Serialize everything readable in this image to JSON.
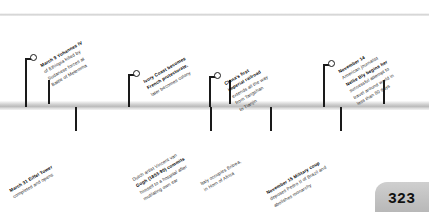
{
  "page": {
    "number": "323",
    "year_spine_label": ""
  },
  "timeline": {
    "ticks_above": [
      48,
      229,
      383
    ],
    "ticks_below": [
      75,
      210,
      270,
      340
    ],
    "events_above": [
      {
        "id": "yohannes-iv",
        "date": "March 9",
        "headline": "Yohannes IV",
        "lines": [
          "March 9 Yohannes IV",
          "of Ethiopia killed by",
          "Sudanese forces at",
          "Battle of Metemma"
        ],
        "bold_segments": [
          "March 9 Yohannes IV",
          "Sudanese"
        ]
      },
      {
        "id": "ivory-coast",
        "date": "",
        "headline": "Ivory Coast",
        "lines": [
          "Ivory Coast becomes",
          "French protectorate,",
          "later becomes colony"
        ],
        "bold_segments": [
          "Ivory Coast",
          "French protectorate,"
        ]
      },
      {
        "id": "china-railroad",
        "date": "",
        "headline": "China's first imperial railroad",
        "lines": [
          "China's first",
          "imperial railroad",
          "extends all the way",
          "from Tangshan",
          "to Tianjin"
        ],
        "bold_segments": [
          "China's first",
          "imperial railroad"
        ]
      },
      {
        "id": "nellie-bly",
        "date": "November 14",
        "headline": "Nellie Bly",
        "lines": [
          "November 14",
          "American journalist",
          "Nellie Bly begins her",
          "successful attempt to",
          "travel around world in",
          "less than 80 days"
        ],
        "bold_segments": [
          "November 14",
          "Nellie Bly"
        ]
      }
    ],
    "events_below": [
      {
        "id": "eiffel-tower",
        "date": "March 31",
        "headline": "Eiffel Tower",
        "lines": [
          "March 31 Eiffel Tower",
          "completed and opens"
        ],
        "bold_segments": [
          "March 31 Eiffel Tower"
        ]
      },
      {
        "id": "van-gogh",
        "date": "",
        "headline": "Vincent van Gogh",
        "lines": [
          "Dutch artist Vincent van",
          "Gogh (1853-90) commits",
          "himself to a hospital after",
          "mutilating own ear"
        ],
        "bold_segments": [
          "Vincent van",
          "Gogh"
        ]
      },
      {
        "id": "eritrea",
        "date": "",
        "headline": "Eritrea",
        "lines": [
          "Italy occupies Eritrea,",
          "in Horn of Africa"
        ],
        "bold_segments": [
          "Eritrea,"
        ]
      },
      {
        "id": "brazil-coup",
        "date": "November 15",
        "headline": "Pedro II of Brazil",
        "lines": [
          "November 15 Military coup",
          "deposes Pedro II of Brazil and",
          "abolishes monarchy"
        ],
        "bold_segments": [
          "November 15",
          "Pedro II of Brazil"
        ]
      }
    ]
  },
  "colors": {
    "ink": "#1a1a1a",
    "text": "#2b2b2b",
    "bar_light": "#f3f3f3",
    "bar_dark": "#bdbdbd",
    "page_tab": "#c2c2c2",
    "background": "#ffffff"
  }
}
